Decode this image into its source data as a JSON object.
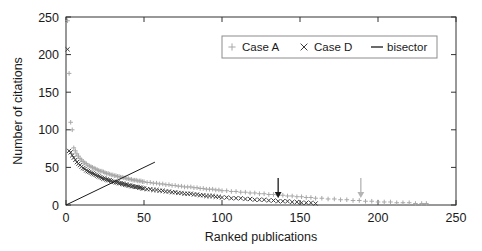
{
  "chart_data": {
    "type": "scatter",
    "title": "",
    "xlabel": "Ranked publications",
    "ylabel": "Number of citations",
    "xlim": [
      0,
      250
    ],
    "ylim": [
      0,
      250
    ],
    "xticks": [
      0,
      50,
      100,
      150,
      200,
      250
    ],
    "yticks": [
      0,
      50,
      100,
      150,
      200,
      250
    ],
    "xtick_labels": [
      "0",
      "50",
      "100",
      "150",
      "200",
      "250"
    ],
    "ytick_labels": [
      "0",
      "50",
      "100",
      "150",
      "200",
      "250"
    ],
    "grid": false,
    "legend": {
      "position": "top-right",
      "entries": [
        {
          "label": "Case A",
          "marker": "plus",
          "color": "#a8a8a8"
        },
        {
          "label": "Case D",
          "marker": "cross",
          "color": "#3c3c3c"
        },
        {
          "label": "bisector",
          "marker": "line",
          "color": "#1a1a1a"
        }
      ]
    },
    "series": [
      {
        "name": "Case A",
        "marker": "plus",
        "color": "#a8a8a8",
        "x": [
          1,
          2,
          3,
          4,
          5,
          6,
          7,
          8,
          9,
          10,
          11,
          12,
          13,
          14,
          15,
          16,
          17,
          18,
          19,
          20,
          21,
          22,
          23,
          24,
          25,
          26,
          27,
          28,
          29,
          30,
          31,
          32,
          33,
          34,
          35,
          36,
          37,
          38,
          39,
          40,
          41,
          42,
          43,
          44,
          45,
          46,
          47,
          48,
          49,
          50,
          52,
          54,
          56,
          58,
          60,
          62,
          64,
          66,
          68,
          70,
          72,
          74,
          76,
          78,
          80,
          82,
          84,
          86,
          88,
          90,
          92,
          94,
          96,
          98,
          100,
          103,
          106,
          109,
          112,
          115,
          118,
          121,
          124,
          127,
          130,
          133,
          136,
          139,
          142,
          145,
          148,
          151,
          154,
          157,
          160,
          164,
          168,
          172,
          176,
          180,
          184,
          188,
          192,
          196,
          200,
          204,
          208,
          212,
          216,
          220,
          224,
          228,
          231
        ],
        "y": [
          245,
          175,
          110,
          100,
          76,
          72,
          68,
          65,
          62,
          60,
          58,
          56,
          55,
          53,
          52,
          51,
          50,
          49,
          48,
          47,
          46,
          45,
          45,
          44,
          43,
          42,
          42,
          41,
          40,
          40,
          39,
          39,
          38,
          38,
          37,
          37,
          36,
          36,
          35,
          35,
          34,
          34,
          33,
          33,
          33,
          32,
          32,
          32,
          31,
          31,
          30,
          30,
          29,
          29,
          28,
          28,
          27,
          27,
          26,
          26,
          25,
          25,
          24,
          24,
          24,
          23,
          23,
          22,
          22,
          21,
          21,
          21,
          20,
          20,
          19,
          19,
          18,
          18,
          17,
          17,
          16,
          16,
          15,
          15,
          14,
          14,
          13,
          13,
          12,
          12,
          11,
          11,
          10,
          10,
          9,
          9,
          8,
          8,
          7,
          7,
          6,
          6,
          5,
          5,
          4,
          4,
          4,
          3,
          3,
          3,
          2,
          2,
          2
        ]
      },
      {
        "name": "Case D",
        "marker": "cross",
        "color": "#3c3c3c",
        "x": [
          1,
          2,
          3,
          4,
          5,
          6,
          7,
          8,
          9,
          10,
          11,
          12,
          13,
          14,
          15,
          16,
          17,
          18,
          19,
          20,
          21,
          22,
          23,
          24,
          25,
          26,
          27,
          28,
          29,
          30,
          31,
          32,
          33,
          34,
          35,
          36,
          37,
          38,
          39,
          40,
          41,
          42,
          43,
          44,
          45,
          46,
          47,
          48,
          49,
          50,
          52,
          54,
          56,
          58,
          60,
          62,
          64,
          66,
          68,
          70,
          72,
          74,
          76,
          78,
          80,
          82,
          84,
          86,
          88,
          90,
          92,
          94,
          96,
          98,
          100,
          103,
          106,
          109,
          112,
          115,
          118,
          121,
          124,
          127,
          130,
          133,
          136,
          139,
          142,
          145,
          148,
          151,
          154,
          157,
          160
        ],
        "y": [
          207,
          72,
          70,
          66,
          63,
          60,
          57,
          55,
          53,
          51,
          49,
          48,
          46,
          45,
          44,
          43,
          42,
          41,
          40,
          39,
          38,
          37,
          36,
          35,
          35,
          34,
          33,
          33,
          32,
          31,
          31,
          30,
          30,
          29,
          29,
          28,
          28,
          27,
          27,
          26,
          26,
          25,
          25,
          24,
          24,
          24,
          23,
          23,
          22,
          22,
          21,
          21,
          20,
          20,
          19,
          19,
          18,
          18,
          17,
          17,
          16,
          16,
          15,
          15,
          15,
          14,
          14,
          13,
          13,
          12,
          12,
          12,
          11,
          11,
          10,
          10,
          9,
          9,
          9,
          8,
          8,
          7,
          7,
          7,
          6,
          6,
          5,
          5,
          5,
          4,
          4,
          3,
          3,
          3,
          2
        ]
      }
    ],
    "bisector": {
      "name": "bisector",
      "color": "#1a1a1a",
      "x": [
        0,
        57
      ],
      "y": [
        0,
        57
      ]
    },
    "annotations": [
      {
        "name": "arrow-case-d",
        "x": 136,
        "y": 24,
        "color": "#1a1a1a",
        "marker": "down-arrow"
      },
      {
        "name": "arrow-case-a",
        "x": 189,
        "y": 24,
        "color": "#b4b4b4",
        "marker": "down-arrow"
      }
    ]
  }
}
